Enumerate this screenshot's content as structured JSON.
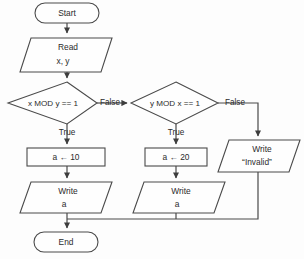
{
  "diagram": {
    "background_color": "#fdfdfd",
    "line_color": "#4a4a4a",
    "text_color": "#2b2b2b",
    "nodes": {
      "start": {
        "label": "Start",
        "shape": "terminator"
      },
      "read": {
        "line1": "Read",
        "line2": "x, y",
        "shape": "parallelogram"
      },
      "cond1": {
        "label": "x MOD y == 1",
        "shape": "diamond"
      },
      "cond2": {
        "label": "y MOD x == 1",
        "shape": "diamond"
      },
      "assign10": {
        "label": "a ← 10",
        "shape": "process"
      },
      "assign20": {
        "label": "a ← 20",
        "shape": "process"
      },
      "write_a_left": {
        "line1": "Write",
        "line2": "a",
        "shape": "parallelogram"
      },
      "write_a_mid": {
        "line1": "Write",
        "line2": "a",
        "shape": "parallelogram"
      },
      "write_invalid": {
        "line1": "Write",
        "line2": "“Invalid”",
        "shape": "parallelogram"
      },
      "end": {
        "label": "End",
        "shape": "terminator"
      }
    },
    "edge_labels": {
      "cond1_false": "False",
      "cond1_true": "True",
      "cond2_false": "False",
      "cond2_true": "True"
    }
  }
}
